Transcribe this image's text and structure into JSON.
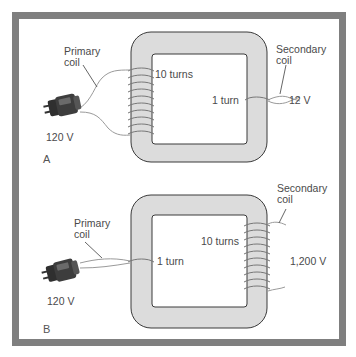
{
  "figure": {
    "frame_color": "#7f7f7f",
    "core_color": "#dcdcdc",
    "core_outline": "#3a3a3a"
  },
  "panels": [
    {
      "id": "A",
      "panel_label": "A",
      "primary": {
        "label_line1": "Primary",
        "label_line2": "coil",
        "turns_label": "10 turns",
        "voltage": "120 V"
      },
      "secondary": {
        "label_line1": "Secondary",
        "label_line2": "coil",
        "turns_label": "1 turn",
        "voltage": "12 V"
      }
    },
    {
      "id": "B",
      "panel_label": "B",
      "primary": {
        "label_line1": "Primary",
        "label_line2": "coil",
        "turns_label": "1 turn",
        "voltage": "120 V"
      },
      "secondary": {
        "label_line1": "Secondary",
        "label_line2": "coil",
        "turns_label": "10 turns",
        "voltage": "1,200 V"
      }
    }
  ]
}
